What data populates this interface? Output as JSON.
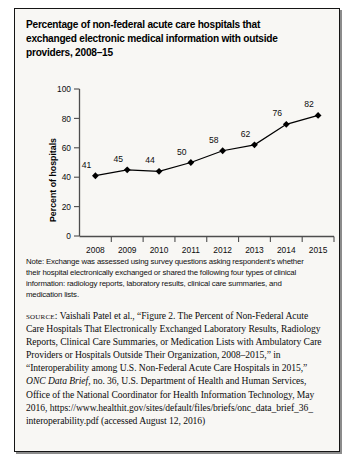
{
  "figure": {
    "title": "Percentage of non-federal acute care hospitals that exchanged electronic medical information with outside providers, 2008–15",
    "note_label": "Note:",
    "note_text": " Exchange was assessed using survey questions asking respondent's whether their hospital electronically exchanged or shared the following four types of clinical information: radiology reports, laboratory results, clinical care summaries, and medication lists.",
    "source_label": "source:",
    "source_text_part1": " Vaishali Patel et al., “Figure 2. The Percent of Non-Federal Acute Care Hospitals That Electronically Exchanged Laboratory Results, Radiology Reports, Clinical Care Summaries, or Medication Lists with Ambulatory Care Providers or Hospitals Outside Their Organization, 2008–2015,” in “Interoperability among U.S. Non-Federal Acute Care Hospitals in 2015,” ",
    "source_italic": "ONC Data Brief",
    "source_text_part2": ", no. 36, U.S. Department of Health and Human Services, Office of the National Coordinator for Health Information Technology, May 2016, https://www.healthit.gov/sites/default/files/briefs/onc_data_brief_36_ interoperability.pdf (accessed August 12, 2016)"
  },
  "chart_data": {
    "type": "line",
    "title": "",
    "xlabel": "",
    "ylabel": "Percent of hospitals",
    "categories": [
      "2008",
      "2009",
      "2010",
      "2011",
      "2012",
      "2013",
      "2014",
      "2015"
    ],
    "values": [
      41,
      45,
      44,
      50,
      58,
      62,
      76,
      82
    ],
    "data_labels": [
      "41",
      "45",
      "44",
      "50",
      "58",
      "62",
      "76",
      "82"
    ],
    "ylim": [
      0,
      100
    ],
    "yticks": [
      0,
      20,
      40,
      60,
      80,
      100
    ],
    "ytick_labels": [
      "0",
      "20",
      "40",
      "60",
      "80",
      "100"
    ],
    "grid": false,
    "legend": "none",
    "marker": "diamond",
    "line_color": "#000000",
    "marker_color": "#000000",
    "plot_background": "#f8f7f4"
  }
}
